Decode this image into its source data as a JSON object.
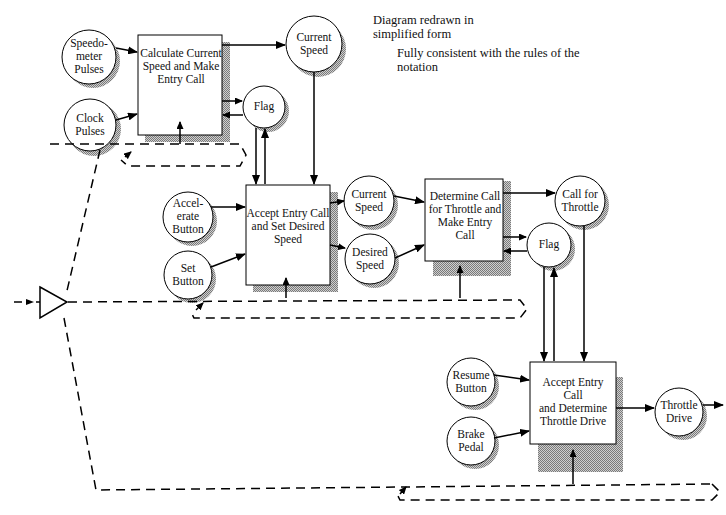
{
  "notes": {
    "line1": "Diagram redrawn in",
    "line2": "simplified form",
    "line3": "Fully consistent with the rules of the",
    "line4": "notation"
  },
  "processes": [
    {
      "id": "calc",
      "lines": [
        "Calculate Current",
        "Speed and Make",
        "Entry Call"
      ]
    },
    {
      "id": "accept1",
      "lines": [
        "Accept Entry Call",
        "and Set Desired",
        "Speed"
      ]
    },
    {
      "id": "determine",
      "lines": [
        "Determine Call",
        "for Throttle and",
        "Make Entry",
        "Call"
      ]
    },
    {
      "id": "accept2",
      "lines": [
        "Accept Entry",
        "Call",
        "and Determine",
        "Throttle Drive"
      ]
    }
  ],
  "stores": [
    {
      "id": "speedometer",
      "lines": [
        "Speedo-",
        "meter",
        "Pulses"
      ]
    },
    {
      "id": "clock",
      "lines": [
        "Clock",
        "Pulses"
      ]
    },
    {
      "id": "current1",
      "lines": [
        "Current",
        "Speed"
      ]
    },
    {
      "id": "flag1",
      "lines": [
        "Flag"
      ]
    },
    {
      "id": "accelerate",
      "lines": [
        "Accel-",
        "erate",
        "Button"
      ]
    },
    {
      "id": "set",
      "lines": [
        "Set",
        "Button"
      ]
    },
    {
      "id": "current2",
      "lines": [
        "Current",
        "Speed"
      ]
    },
    {
      "id": "desired",
      "lines": [
        "Desired",
        "Speed"
      ]
    },
    {
      "id": "callthrottle",
      "lines": [
        "Call for",
        "Throttle"
      ]
    },
    {
      "id": "flag2",
      "lines": [
        "Flag"
      ]
    },
    {
      "id": "resume",
      "lines": [
        "Resume",
        "Button"
      ]
    },
    {
      "id": "brake",
      "lines": [
        "Brake",
        "Pedal"
      ]
    },
    {
      "id": "throttledrive",
      "lines": [
        "Throttle",
        "Drive"
      ]
    }
  ]
}
